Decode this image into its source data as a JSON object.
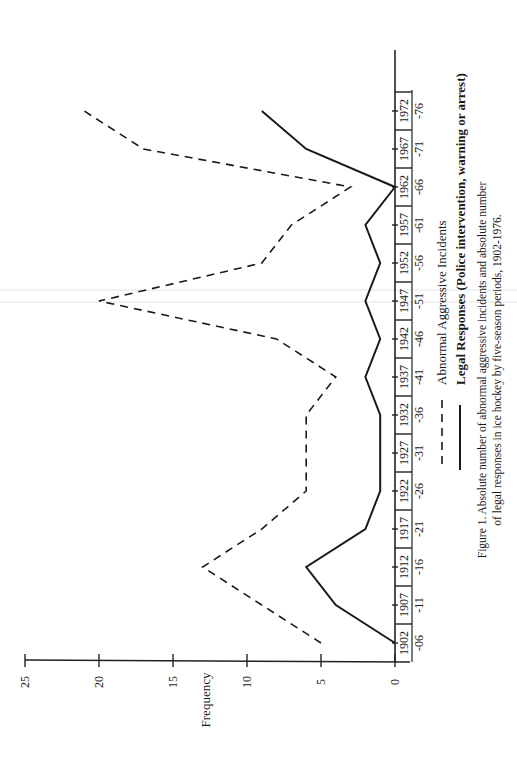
{
  "chart_data": {
    "type": "line",
    "orientation": "rotated-90-ccw",
    "title": "",
    "caption_line1": "Figure 1. Absolute number of abnormal aggressive incidents and absolute number",
    "caption_line2": "of legal responses in ice hockey by five-season periods, 1902-1976.",
    "xlabel": "",
    "ylabel": "Frequency",
    "ylim": [
      0,
      25
    ],
    "yticks": [
      "0",
      "5",
      "10",
      "15",
      "20",
      "25"
    ],
    "categories": [
      {
        "top": "1902",
        "bottom": "-06"
      },
      {
        "top": "1907",
        "bottom": "-11"
      },
      {
        "top": "1912",
        "bottom": "-16"
      },
      {
        "top": "1917",
        "bottom": "-21"
      },
      {
        "top": "1922",
        "bottom": "-26"
      },
      {
        "top": "1927",
        "bottom": "-31"
      },
      {
        "top": "1932",
        "bottom": "-36"
      },
      {
        "top": "1937",
        "bottom": "-41"
      },
      {
        "top": "1942",
        "bottom": "-46"
      },
      {
        "top": "1947",
        "bottom": "-51"
      },
      {
        "top": "1952",
        "bottom": "-56"
      },
      {
        "top": "1957",
        "bottom": "-61"
      },
      {
        "top": "1962",
        "bottom": "-66"
      },
      {
        "top": "1967",
        "bottom": "-71"
      },
      {
        "top": "1972",
        "bottom": "-76"
      }
    ],
    "series": [
      {
        "name": "Abnormal Aggressive Incidents",
        "style": "dashed",
        "values": [
          5,
          9,
          13,
          9,
          6,
          6,
          6,
          4,
          8,
          20,
          9,
          7,
          3,
          17,
          21
        ]
      },
      {
        "name": "Legal Responses (Police intervention, warning or arrest)",
        "style": "solid",
        "values": [
          0,
          4,
          6,
          2,
          1,
          1,
          1,
          2,
          1,
          2,
          1,
          2,
          0,
          6,
          9
        ]
      }
    ],
    "grid": false,
    "legend_position": "bottom"
  },
  "legend": {
    "dashed_label": "Abnormal Aggressive Incidents",
    "solid_label": "Legal Responses (Police intervention, warning or arrest)"
  },
  "colors": {
    "ink": "#1a1a1a",
    "background": "#ffffff"
  }
}
